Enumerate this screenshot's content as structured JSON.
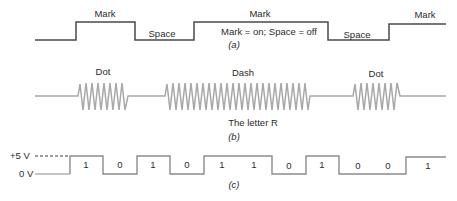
{
  "panel_a": {
    "caption": "(a)",
    "labels": [
      "Mark",
      "Space",
      "Mark",
      "Space",
      "Mark"
    ],
    "legend": "Mark = on; Space = off",
    "stroke_color": "#4a4a4a"
  },
  "panel_b": {
    "caption": "(b)",
    "labels": [
      "Dot",
      "Dash",
      "Dot"
    ],
    "subtitle": "The letter R",
    "stroke_color": "#a8a8a8"
  },
  "panel_c": {
    "caption": "(c)",
    "high_level_label": "+5 V",
    "low_level_label": "0 V",
    "bits": [
      "1",
      "0",
      "1",
      "0",
      "1",
      "1",
      "0",
      "1",
      "0",
      "0",
      "1"
    ],
    "stroke_color": "#8c8c8c"
  }
}
